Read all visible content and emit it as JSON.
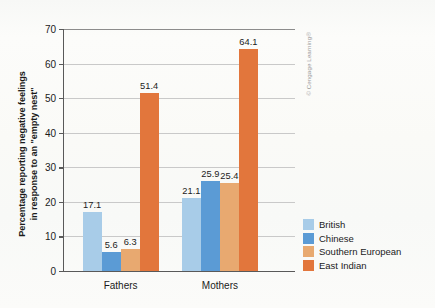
{
  "chart_data": {
    "type": "bar",
    "title": "",
    "xlabel": "",
    "ylabel": "Percentage reporting negative feelings in response to an \"empty nest\"",
    "ylabel_lines": [
      "Percentage reporting negative feelings",
      "in response to an \"empty nest\""
    ],
    "categories": [
      "Fathers",
      "Mothers"
    ],
    "series": [
      {
        "name": "British",
        "color": "#a8cce8",
        "values": [
          17.1,
          21.1
        ]
      },
      {
        "name": "Chinese",
        "color": "#5b9bd5",
        "values": [
          5.6,
          25.9
        ]
      },
      {
        "name": "Southern European",
        "color": "#e8a970",
        "values": [
          6.3,
          25.4
        ]
      },
      {
        "name": "East Indian",
        "color": "#e2763c",
        "values": [
          51.4,
          64.1
        ]
      }
    ],
    "ylim": [
      0,
      70
    ],
    "ytick_step": 10,
    "yticks": [
      "70",
      "60",
      "50",
      "40",
      "30",
      "20",
      "10",
      "0"
    ],
    "grid": "horizontal",
    "legend_position": "right",
    "value_labels": {
      "Fathers": [
        "17.1",
        "5.6",
        "6.3",
        "51.4"
      ],
      "Mothers": [
        "21.1",
        "25.9",
        "25.4",
        "64.1"
      ]
    }
  },
  "legend": {
    "items": [
      {
        "label": "British",
        "color": "#a8cce8"
      },
      {
        "label": "Chinese",
        "color": "#5b9bd5"
      },
      {
        "label": "Southern European",
        "color": "#e8a970"
      },
      {
        "label": "East Indian",
        "color": "#e2763c"
      }
    ]
  },
  "credit": {
    "text": "© Cengage Learning®"
  },
  "colors": {
    "british": "#a8cce8",
    "chinese": "#5b9bd5",
    "southern_european": "#e8a970",
    "east_indian": "#e2763c",
    "axis": "#595959",
    "grid": "#c9c9c9",
    "background": "#fbfbf8"
  }
}
